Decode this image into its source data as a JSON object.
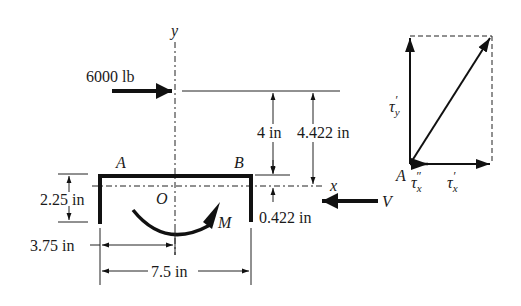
{
  "diagram": {
    "type": "free-body / shear-flow diagram of channel section",
    "axes": {
      "x_label": "x",
      "y_label": "y",
      "origin_label": "O"
    },
    "points": {
      "left_corner": "A",
      "right_corner": "B",
      "vector_origin": "A"
    },
    "loads": {
      "horizontal_force": "6000 lb",
      "shear_force": "V",
      "moment": "M"
    },
    "dimensions": {
      "force_to_flange": "4 in",
      "force_to_centroid": "4.422 in",
      "flange_to_centroid": "0.422 in",
      "leg_height": "2.25 in",
      "half_width": "3.75 in",
      "full_width": "7.5 in"
    },
    "vector_diagram": {
      "tau_y_prime": "τ",
      "tau_y_prime_sub": "y",
      "tau_y_prime_mark": "′",
      "tau_x_double_prime": "τ",
      "tau_x_double_prime_sub": "x",
      "tau_x_double_prime_mark": "″",
      "tau_x_prime": "τ",
      "tau_x_prime_sub": "x",
      "tau_x_prime_mark": "′"
    }
  },
  "colors": {
    "ink": "#111111",
    "background": "#ffffff"
  }
}
